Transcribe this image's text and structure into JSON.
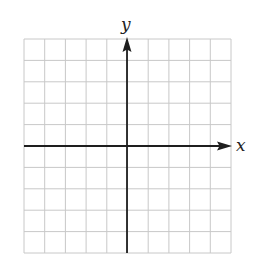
{
  "diagram": {
    "type": "coordinate-plane",
    "x_axis_label": "x",
    "y_axis_label": "y",
    "grid": {
      "columns": 10,
      "rows": 10,
      "left": 24,
      "top": 39,
      "right": 231,
      "bottom": 253
    },
    "origin_px": {
      "x": 127,
      "y": 146
    },
    "colors": {
      "grid": "#c8c8c8",
      "axis": "#1e1e1e",
      "background": "#ffffff"
    }
  }
}
